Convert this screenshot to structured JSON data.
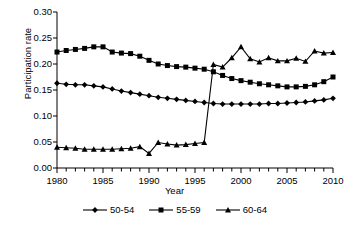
{
  "chart_data": {
    "type": "line",
    "title": "",
    "xlabel": "Year",
    "ylabel": "Participation rate",
    "xlim": [
      1980,
      2010
    ],
    "ylim": [
      0.0,
      0.3
    ],
    "yticks": [
      "0.00",
      "0.05",
      "0.10",
      "0.15",
      "0.20",
      "0.25",
      "0.30"
    ],
    "ytick_values": [
      0.0,
      0.05,
      0.1,
      0.15,
      0.2,
      0.25,
      0.3
    ],
    "xticks": [
      "1980",
      "1985",
      "1990",
      "1995",
      "2000",
      "2005",
      "2010"
    ],
    "xtick_values": [
      1980,
      1985,
      1990,
      1995,
      2000,
      2005,
      2010
    ],
    "xtick_minor_step": 1,
    "grid": false,
    "legend_position": "bottom",
    "x": [
      1980,
      1981,
      1982,
      1983,
      1984,
      1985,
      1986,
      1987,
      1988,
      1989,
      1990,
      1991,
      1992,
      1993,
      1994,
      1995,
      1996,
      1997,
      1998,
      1999,
      2000,
      2001,
      2002,
      2003,
      2004,
      2005,
      2006,
      2007,
      2008,
      2009,
      2010
    ],
    "series": [
      {
        "name": "50-54",
        "marker": "diamond",
        "values": [
          0.163,
          0.161,
          0.16,
          0.16,
          0.158,
          0.156,
          0.152,
          0.148,
          0.145,
          0.142,
          0.139,
          0.136,
          0.134,
          0.132,
          0.13,
          0.128,
          0.126,
          0.124,
          0.123,
          0.123,
          0.123,
          0.123,
          0.123,
          0.124,
          0.124,
          0.125,
          0.126,
          0.127,
          0.129,
          0.131,
          0.134
        ]
      },
      {
        "name": "55-59",
        "marker": "square",
        "values": [
          0.223,
          0.226,
          0.228,
          0.23,
          0.233,
          0.233,
          0.223,
          0.221,
          0.22,
          0.215,
          0.207,
          0.2,
          0.197,
          0.195,
          0.194,
          0.192,
          0.19,
          0.185,
          0.178,
          0.172,
          0.168,
          0.165,
          0.162,
          0.16,
          0.158,
          0.156,
          0.156,
          0.157,
          0.16,
          0.166,
          0.175
        ]
      },
      {
        "name": "60-64",
        "marker": "triangle",
        "values": [
          0.04,
          0.039,
          0.038,
          0.036,
          0.036,
          0.036,
          0.036,
          0.037,
          0.038,
          0.041,
          0.028,
          0.049,
          0.046,
          0.044,
          0.045,
          0.047,
          0.049,
          0.199,
          0.194,
          0.212,
          0.233,
          0.21,
          0.204,
          0.212,
          0.206,
          0.206,
          0.211,
          0.205,
          0.225,
          0.221,
          0.222
        ]
      }
    ],
    "legend": [
      {
        "label": "50-54",
        "marker": "diamond"
      },
      {
        "label": "55-59",
        "marker": "square"
      },
      {
        "label": "60-64",
        "marker": "triangle"
      }
    ],
    "colors": {
      "series": "#000000",
      "axis": "#000000",
      "background": "#ffffff"
    }
  },
  "layout": {
    "plot": {
      "left": 57,
      "top": 12,
      "right": 333,
      "bottom": 168
    },
    "ylabel_top": 58,
    "xlabel_top": 186,
    "legend_top": 205
  }
}
